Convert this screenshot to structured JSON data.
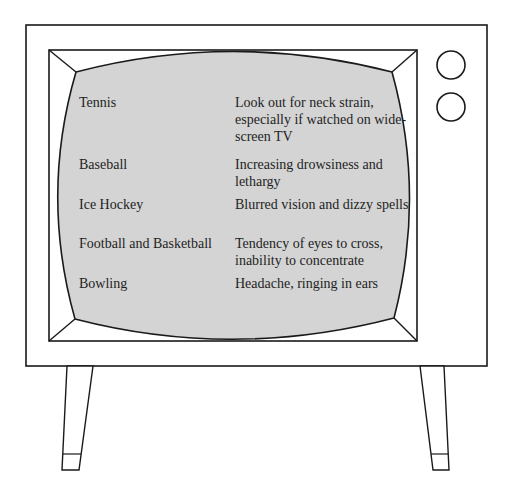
{
  "colors": {
    "background": "#ffffff",
    "screen_fill": "#d4d4d4",
    "outline": "#1a1a1a",
    "text": "#1e1e1e"
  },
  "tv": {
    "knobs": [
      {
        "name": "knob-top"
      },
      {
        "name": "knob-bottom"
      }
    ]
  },
  "screen": {
    "rows": [
      {
        "sport": "Tennis",
        "effect": "Look out for neck strain, especially if watched on wide-screen TV"
      },
      {
        "sport": "Baseball",
        "effect": "Increasing drowsiness and lethargy"
      },
      {
        "sport": "Ice Hockey",
        "effect": "Blurred vision and dizzy spells"
      },
      {
        "sport": "Football and Basketball",
        "effect": "Tendency of eyes to cross, inability to concentrate"
      },
      {
        "sport": "Bowling",
        "effect": "Headache, ringing in ears"
      }
    ]
  }
}
